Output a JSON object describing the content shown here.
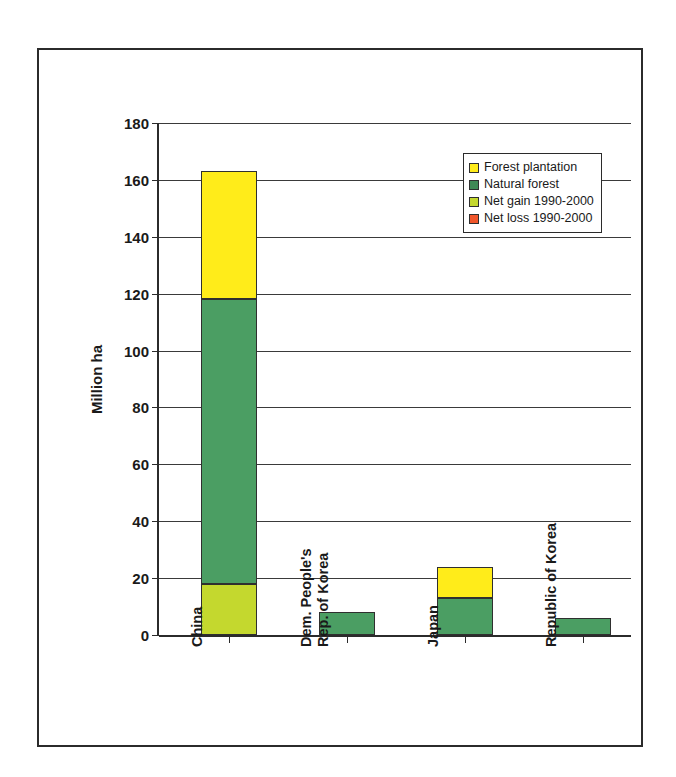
{
  "chart_data": {
    "type": "bar",
    "subtype": "stacked-column",
    "title": "",
    "xlabel": "",
    "ylabel": "Million ha",
    "ylim": [
      0,
      180
    ],
    "ytick_step": 20,
    "yticks": [
      0,
      20,
      40,
      60,
      80,
      100,
      120,
      140,
      160,
      180
    ],
    "ytick_labels": [
      "0",
      "20",
      "40",
      "60",
      "80",
      "100",
      "120",
      "140",
      "160",
      "180"
    ],
    "grid": true,
    "grid_axis": "y",
    "legend_position": "inside-top-right",
    "categories": [
      "China",
      "Dem. People's Rep. of Korea",
      "Japan",
      "Republic of Korea"
    ],
    "category_label_lines": [
      [
        "China"
      ],
      [
        "Dem. People's",
        "Rep. of Korea"
      ],
      [
        "Japan"
      ],
      [
        "Republic of Korea"
      ]
    ],
    "category_label_rotation": -90,
    "series": [
      {
        "name": "Net gain 1990-2000",
        "color": "#C4D82E",
        "values": [
          18,
          0,
          0,
          0
        ]
      },
      {
        "name": "Natural forest",
        "color": "#4B9E63",
        "values": [
          100,
          8,
          13,
          6
        ]
      },
      {
        "name": "Forest plantation",
        "color": "#FFEC1A",
        "values": [
          45,
          0,
          11,
          0
        ]
      },
      {
        "name": "Net loss 1990-2000",
        "color": "#F0562B",
        "values": [
          0,
          0,
          0,
          0
        ]
      }
    ],
    "stack_totals": [
      163,
      8,
      24,
      6
    ],
    "legend_entries": [
      {
        "label": "Forest plantation",
        "color": "#FFEC1A"
      },
      {
        "label": "Natural forest",
        "color": "#3F8A56"
      },
      {
        "label": "Net gain 1990-2000",
        "color": "#C4D82E"
      },
      {
        "label": "Net loss 1990-2000",
        "color": "#F0562B"
      }
    ],
    "colors": {
      "forest_plantation": "#FFEC1A",
      "natural_forest": "#4B9E63",
      "net_gain": "#C4D82E",
      "net_loss": "#F0562B",
      "axis": "#2b2b2b",
      "gridline": "#3a3a3a",
      "background": "#ffffff"
    }
  }
}
